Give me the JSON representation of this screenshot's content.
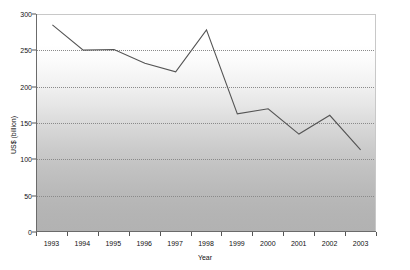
{
  "chart_data": {
    "type": "line",
    "title": "",
    "subtitle": "",
    "xlabel": "Year",
    "ylabel": "US$ (billion)",
    "categories": [
      "1993",
      "1994",
      "1995",
      "1996",
      "1997",
      "1998",
      "1999",
      "2000",
      "2001",
      "2002",
      "2003"
    ],
    "values": [
      285,
      250,
      251,
      232,
      220,
      278,
      162,
      169,
      134,
      160,
      112
    ],
    "series": [
      {
        "name": "",
        "values": [
          285,
          250,
          251,
          232,
          220,
          278,
          162,
          169,
          134,
          160,
          112
        ]
      }
    ],
    "ylim": [
      0,
      300
    ],
    "yticks": [
      0,
      50,
      100,
      150,
      200,
      250,
      300
    ],
    "ytick_labels": [
      "0",
      "50",
      "100",
      "150",
      "200",
      "250",
      "300"
    ],
    "grid": true,
    "gridlines": "horizontal-dotted",
    "legend": "none",
    "legend_position": "none",
    "markers": false,
    "line_color": "#545454",
    "plot_background": "vertical-gradient-white-to-gray",
    "plot_bg_top_color": "#ffffff",
    "plot_bg_bottom_color": "#b2b2b2",
    "axis_color": "#6b6b6b",
    "gridline_color": "#8a8a8a"
  }
}
